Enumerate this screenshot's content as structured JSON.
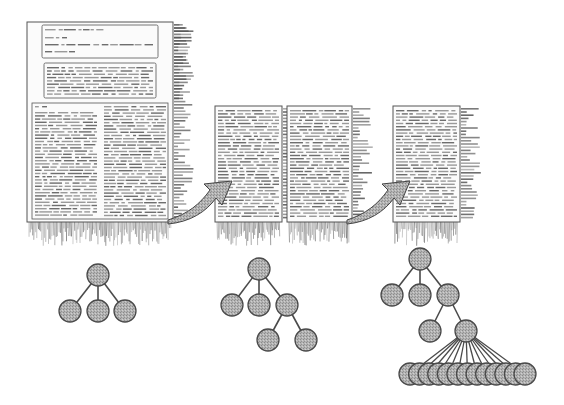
{
  "figure": {
    "colors": {
      "page_fill": "#fbfbfb",
      "page_border": "#555555",
      "text_line": "#9a9a9a",
      "text_line_dark": "#6e6e6e",
      "fringe": "#555555",
      "arrow_fill": "#a8a8a8",
      "arrow_edge": "#444444",
      "node_fill": "#a9a9a9",
      "node_stroke": "#4a4a4a",
      "edge": "#4a4a4a"
    }
  },
  "pages": [
    {
      "id": "page-1",
      "x": 27,
      "y": 22,
      "w": 146,
      "h": 200,
      "layout": "title-abstract-two-column",
      "text": "illegible blurred document text"
    },
    {
      "id": "page-2",
      "x": 215,
      "y": 106,
      "w": 67,
      "h": 116,
      "layout": "single-column",
      "text": "illegible blurred document text"
    },
    {
      "id": "page-3",
      "x": 287,
      "y": 106,
      "w": 65,
      "h": 116,
      "layout": "single-column",
      "text": "illegible blurred document text"
    },
    {
      "id": "page-4",
      "x": 393,
      "y": 106,
      "w": 67,
      "h": 116,
      "layout": "single-column",
      "text": "illegible blurred document text"
    }
  ],
  "arrows": [
    {
      "id": "arrow-1",
      "from": "page-1",
      "to": "page-2"
    },
    {
      "id": "arrow-2",
      "from": "page-3",
      "to": "page-4"
    }
  ],
  "trees": [
    {
      "id": "tree-1",
      "nodes": [
        [
          98,
          275
        ],
        [
          70,
          311
        ],
        [
          98,
          311
        ],
        [
          125,
          311
        ]
      ],
      "edges": [
        [
          0,
          1
        ],
        [
          0,
          2
        ],
        [
          0,
          3
        ]
      ]
    },
    {
      "id": "tree-2",
      "nodes": [
        [
          259,
          269
        ],
        [
          232,
          305
        ],
        [
          259,
          305
        ],
        [
          287,
          305
        ],
        [
          268,
          340
        ],
        [
          306,
          340
        ]
      ],
      "edges": [
        [
          0,
          1
        ],
        [
          0,
          2
        ],
        [
          0,
          3
        ],
        [
          3,
          4
        ],
        [
          3,
          5
        ]
      ]
    },
    {
      "id": "tree-3",
      "nodes": [
        [
          420,
          259
        ],
        [
          392,
          295
        ],
        [
          420,
          295
        ],
        [
          448,
          295
        ],
        [
          430,
          331
        ],
        [
          466,
          331
        ]
      ],
      "edges": [
        [
          0,
          1
        ],
        [
          0,
          2
        ],
        [
          0,
          3
        ],
        [
          3,
          4
        ],
        [
          3,
          5
        ]
      ],
      "leaf_fan": {
        "parent": 5,
        "count": 13,
        "y": 374,
        "x_start": 410,
        "x_end": 525
      }
    }
  ],
  "node_radius": 11
}
